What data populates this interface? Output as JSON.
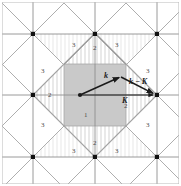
{
  "figure": {
    "background_color": "#ffffff",
    "grid_color": "#8c8c8c",
    "lattice_point_color": "#111111",
    "shaded_square_color": "#c9c9c9",
    "diamond_color": "#9a9a9a",
    "hatch_color": "#b0b0b0",
    "vector_color": "#1a1a1a"
  },
  "zone_labels": [
    {
      "text": "1",
      "x": 84,
      "y": 112
    },
    {
      "text": "2",
      "x": 93,
      "y": 45
    },
    {
      "text": "2",
      "x": 48,
      "y": 92
    },
    {
      "text": "2",
      "x": 124,
      "y": 103
    },
    {
      "text": "2",
      "x": 93,
      "y": 140
    },
    {
      "text": "3",
      "x": 72,
      "y": 42
    },
    {
      "text": "3",
      "x": 115,
      "y": 42
    },
    {
      "text": "3",
      "x": 41,
      "y": 68
    },
    {
      "text": "3",
      "x": 146,
      "y": 68
    },
    {
      "text": "3",
      "x": 41,
      "y": 122
    },
    {
      "text": "3",
      "x": 146,
      "y": 122
    },
    {
      "text": "3",
      "x": 72,
      "y": 148
    },
    {
      "text": "3",
      "x": 115,
      "y": 148
    }
  ],
  "vector_labels": [
    {
      "name": "k",
      "text": "k",
      "x": 104,
      "y": 76
    },
    {
      "name": "k-K",
      "text": "k − K",
      "x": 133,
      "y": 82
    },
    {
      "name": "K",
      "text": "K",
      "x": 123,
      "y": 100
    }
  ],
  "lattice_points": [
    {
      "x": 33,
      "y": 34
    },
    {
      "x": 95,
      "y": 34
    },
    {
      "x": 157,
      "y": 34
    },
    {
      "x": 33,
      "y": 95
    },
    {
      "x": 95,
      "y": 95
    },
    {
      "x": 157,
      "y": 95
    },
    {
      "x": 33,
      "y": 157
    },
    {
      "x": 95,
      "y": 157
    },
    {
      "x": 157,
      "y": 157
    }
  ],
  "grid_lines": {
    "vertical_x": [
      33,
      95,
      157
    ],
    "horizontal_y": [
      34,
      95,
      157
    ]
  },
  "shaded_square": {
    "x": 64,
    "y": 64,
    "width": 62,
    "height": 62
  },
  "diamond": {
    "cx": 95,
    "cy": 95,
    "half_diagonal": 62
  },
  "vectors": [
    {
      "name": "k",
      "x1": 80,
      "y1": 95,
      "x2": 121,
      "y2": 77
    },
    {
      "name": "k-K",
      "x1": 121,
      "y1": 77,
      "x2": 156,
      "y2": 94
    },
    {
      "name": "K",
      "x1": 80,
      "y1": 95,
      "x2": 156,
      "y2": 95
    }
  ]
}
